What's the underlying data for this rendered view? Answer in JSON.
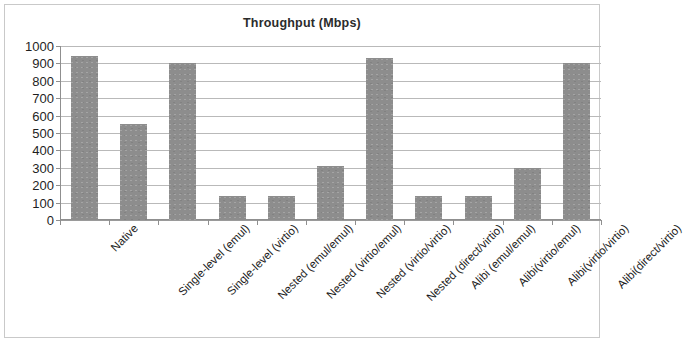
{
  "chart_data": {
    "type": "bar",
    "title": "Throughput (Mbps)",
    "xlabel": "",
    "ylabel": "",
    "ylim": [
      0,
      1000
    ],
    "ytick_step": 100,
    "yticks": [
      "1000",
      "900",
      "800",
      "700",
      "600",
      "500",
      "400",
      "300",
      "200",
      "100",
      "0"
    ],
    "grid": true,
    "legend": "none",
    "bar_color": "#8d8d8d",
    "categories": [
      "Native",
      "Single-level (emul)",
      "Single-level (virtio)",
      "Nested (emul/emul)",
      "Nested (virtio/emul)",
      "Nested (virtio/virtio)",
      "Nested (direct/virtio)",
      "Alibi (emul/emul)",
      "Alibi(virtio/emul)",
      "Alibi(virtio/virtio)",
      "Alibi(direct/virtio)"
    ],
    "values": [
      940,
      550,
      900,
      140,
      140,
      310,
      930,
      140,
      140,
      300,
      900
    ]
  }
}
